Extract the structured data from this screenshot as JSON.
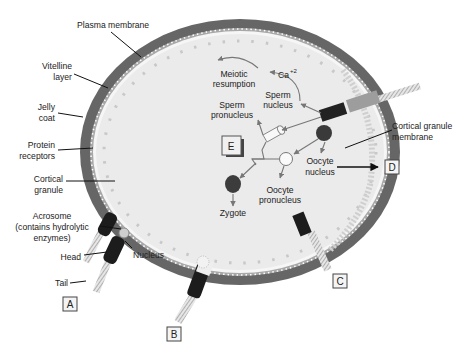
{
  "diagram": {
    "outer_labels": {
      "plasma_membrane": "Plasma membrane",
      "vitelline_layer_1": "Vitelline",
      "vitelline_layer_2": "layer",
      "jelly_coat_1": "Jelly",
      "jelly_coat_2": "coat",
      "protein_receptors_1": "Protein",
      "protein_receptors_2": "receptors",
      "cortical_granule_1": "Cortical",
      "cortical_granule_2": "granule",
      "cortical_granule_membrane_1": "Cortical granule",
      "cortical_granule_membrane_2": "membrane"
    },
    "sperm_labels": {
      "acrosome_1": "Acrosome",
      "acrosome_2": "(contains hydrolytic",
      "acrosome_3": "enzymes)",
      "head": "Head",
      "nucleus": "Nucleus",
      "tail": "Tail"
    },
    "inner_labels": {
      "meiotic_1": "Meiotic",
      "meiotic_2": "resumption",
      "calcium": "Ca",
      "calcium_sup": "+2",
      "sperm_nucleus_1": "Sperm",
      "sperm_nucleus_2": "nucleus",
      "sperm_pronucleus_1": "Sperm",
      "sperm_pronucleus_2": "pronucleus",
      "oocyte_nucleus_1": "Oocyte",
      "oocyte_nucleus_2": "nucleus",
      "oocyte_pronucleus_1": "Oocyte",
      "oocyte_pronucleus_2": "pronucleus",
      "zygote": "Zygote"
    },
    "stage_boxes": {
      "a": "A",
      "b": "B",
      "c": "C",
      "d": "D",
      "e": "E"
    },
    "colors": {
      "jelly_coat": "#6b6b6b",
      "cytoplasm": "#ececec",
      "vitelline": "#9a9a9a",
      "nucleus_dark": "#3a3a3a",
      "label_box_bg": "#f4f4f4"
    }
  }
}
